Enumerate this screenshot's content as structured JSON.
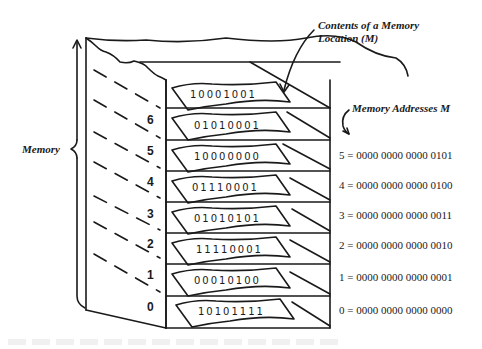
{
  "labels": {
    "memory": "Memory",
    "contents_line1": "Contents of a Memory",
    "contents_line2": "Location (M)",
    "addresses": "Memory Addresses M"
  },
  "locations": [
    {
      "index": "",
      "contents": "10001001"
    },
    {
      "index": "6",
      "contents": "01010001"
    },
    {
      "index": "5",
      "contents": "10000000"
    },
    {
      "index": "4",
      "contents": "01110001"
    },
    {
      "index": "3",
      "contents": "01010101"
    },
    {
      "index": "2",
      "contents": "11110001"
    },
    {
      "index": "1",
      "contents": "00010100"
    },
    {
      "index": "0",
      "contents": "10101111"
    }
  ],
  "addresses": [
    {
      "text": "5 = 0000 0000 0000 0101"
    },
    {
      "text": "4 = 0000 0000 0000 0100"
    },
    {
      "text": "3 = 0000 0000 0000 0011"
    },
    {
      "text": "2 = 0000 0000 0000 0010"
    },
    {
      "text": "1 = 0000 0000 0000 0001"
    },
    {
      "text": "0 = 0000 0000 0000 0000"
    }
  ],
  "colors": {
    "ink": "#1a1a1a",
    "background": "#ffffff"
  }
}
